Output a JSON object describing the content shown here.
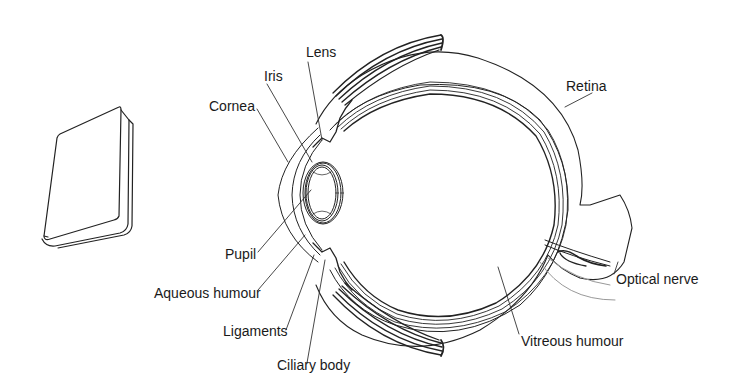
{
  "diagram": {
    "type": "anatomy-cross-section",
    "object": "book",
    "line_color": "#222222",
    "labels": [
      {
        "id": "lens",
        "text": "Lens",
        "x": 306,
        "y": 46
      },
      {
        "id": "iris",
        "text": "Iris",
        "x": 265,
        "y": 69
      },
      {
        "id": "cornea",
        "text": "Cornea",
        "x": 210,
        "y": 99
      },
      {
        "id": "retina",
        "text": "Retina",
        "x": 566,
        "y": 79
      },
      {
        "id": "pupil",
        "text": "Pupil",
        "x": 226,
        "y": 247
      },
      {
        "id": "aqueous_humour",
        "text": "Aqueous humour",
        "x": 155,
        "y": 286
      },
      {
        "id": "ligaments",
        "text": "Ligaments",
        "x": 223,
        "y": 324
      },
      {
        "id": "ciliary_body",
        "text": "Ciliary body",
        "x": 277,
        "y": 358
      },
      {
        "id": "vitreous_humour",
        "text": "Vitreous humour",
        "x": 521,
        "y": 334
      },
      {
        "id": "optical_nerve",
        "text": "Optical nerve",
        "x": 616,
        "y": 272
      }
    ]
  }
}
